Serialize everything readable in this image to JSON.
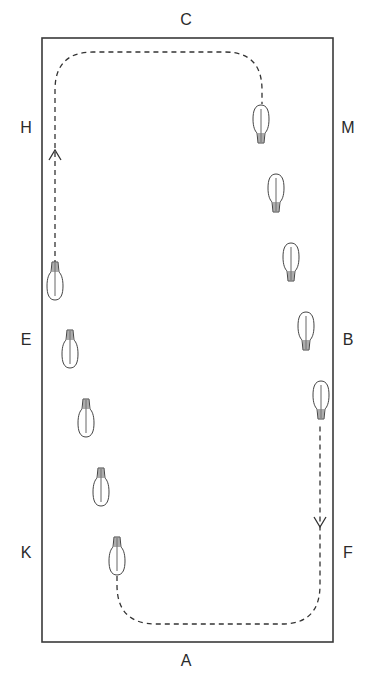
{
  "diagram": {
    "type": "dressage-arena-figure",
    "arena": {
      "x": 42,
      "y": 38,
      "width": 291,
      "height": 604,
      "border_color": "#3a3a3a"
    },
    "markers": [
      {
        "letter": "C",
        "x": 186,
        "y": 20
      },
      {
        "letter": "H",
        "x": 26,
        "y": 128
      },
      {
        "letter": "M",
        "x": 348,
        "y": 128
      },
      {
        "letter": "E",
        "x": 26,
        "y": 340
      },
      {
        "letter": "B",
        "x": 348,
        "y": 340
      },
      {
        "letter": "K",
        "x": 26,
        "y": 553
      },
      {
        "letter": "F",
        "x": 348,
        "y": 553
      },
      {
        "letter": "A",
        "x": 186,
        "y": 661
      }
    ],
    "path": {
      "style": "dashed",
      "color": "#333333",
      "arrows": [
        {
          "name": "arrow-up-near-H",
          "x": 55,
          "y": 150,
          "direction": "up"
        },
        {
          "name": "arrow-down-near-F",
          "x": 320,
          "y": 527,
          "direction": "down"
        }
      ]
    },
    "horses": {
      "right_track_heading": "down",
      "left_track_heading": "up",
      "right_track": [
        {
          "x": 261,
          "y": 127
        },
        {
          "x": 276,
          "y": 196
        },
        {
          "x": 291,
          "y": 265
        },
        {
          "x": 306,
          "y": 334
        },
        {
          "x": 321,
          "y": 403
        }
      ],
      "left_track": [
        {
          "x": 55,
          "y": 278
        },
        {
          "x": 70,
          "y": 346
        },
        {
          "x": 86,
          "y": 415
        },
        {
          "x": 101,
          "y": 484
        },
        {
          "x": 117,
          "y": 553
        }
      ]
    }
  }
}
